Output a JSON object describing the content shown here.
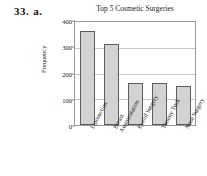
{
  "problem": {
    "number": "33.",
    "part": "a."
  },
  "chart_data": {
    "type": "bar",
    "title": "Top 5 Cosmetic Surgeries",
    "xlabel": "",
    "ylabel": "Frequency",
    "categories": [
      "Liposuction",
      "Breast Augmentation",
      "Eyelid Surgery",
      "Tummy Tuck",
      "Nose Surgery"
    ],
    "category_lines": [
      [
        "Liposuction"
      ],
      [
        "Breast",
        "Augmentation"
      ],
      [
        "Eyelid Surgery"
      ],
      [
        "Tummy Tuck"
      ],
      [
        "Nose Surgery"
      ]
    ],
    "values": [
      365,
      315,
      162,
      162,
      150
    ],
    "ylim": [
      0,
      400
    ],
    "yticks": [
      0,
      100,
      200,
      300,
      400
    ],
    "ytick_labels": [
      "0",
      "100",
      "200",
      "300",
      "400"
    ],
    "grid": true,
    "legend": false,
    "bar_fill": "#d2d2d2",
    "bar_edge": "#5e5e5e",
    "frame_color": "#9a9a9a",
    "grid_color": "#c8c8c8",
    "background": "#ffffff"
  }
}
